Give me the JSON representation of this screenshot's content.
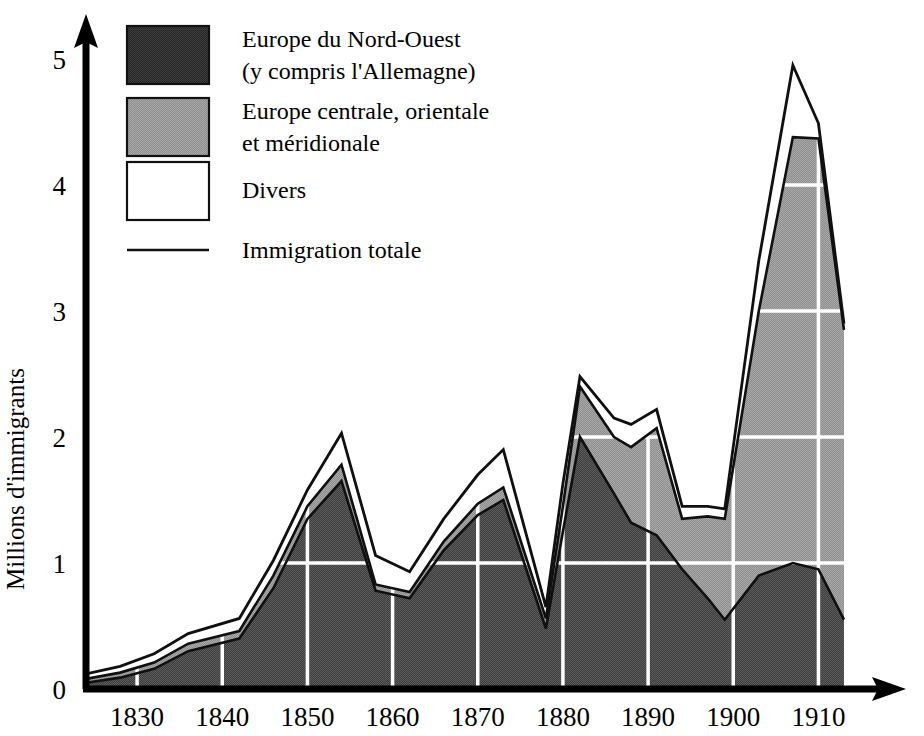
{
  "chart_data": {
    "type": "area",
    "title": "",
    "xlabel": "",
    "ylabel": "Millions d'immigrants",
    "xlim": [
      1824,
      1915
    ],
    "ylim": [
      0,
      5
    ],
    "xticks": [
      "1830",
      "1840",
      "1850",
      "1860",
      "1870",
      "1880",
      "1890",
      "1900",
      "1910"
    ],
    "xtick_values": [
      1830,
      1840,
      1850,
      1860,
      1870,
      1880,
      1890,
      1900,
      1910
    ],
    "yticks": [
      "0",
      "1",
      "2",
      "3",
      "4",
      "5"
    ],
    "ytick_values": [
      0,
      1,
      2,
      3,
      4,
      5
    ],
    "grid": true,
    "grid_color": "#ffffff",
    "stacked": true,
    "legend_position": "top-left",
    "x": [
      1824,
      1828,
      1832,
      1836,
      1842,
      1846,
      1850,
      1854,
      1858,
      1862,
      1866,
      1870,
      1873,
      1878,
      1880,
      1882,
      1886,
      1888,
      1891,
      1894,
      1897,
      1899,
      1903,
      1907,
      1910,
      1913
    ],
    "series": [
      {
        "name": "Europe du Nord-Ouest (y compris l'Allemagne)",
        "color": "#4d4d4d",
        "values": [
          0.05,
          0.09,
          0.16,
          0.3,
          0.4,
          0.8,
          1.35,
          1.65,
          0.78,
          0.72,
          1.1,
          1.38,
          1.5,
          0.48,
          1.25,
          2.0,
          1.55,
          1.32,
          1.22,
          0.95,
          0.72,
          0.55,
          0.9,
          1.0,
          0.95,
          0.55
        ]
      },
      {
        "name": "Europe centrale, orientale et méridionale",
        "color": "#9a9a9a",
        "values": [
          0.03,
          0.04,
          0.05,
          0.06,
          0.06,
          0.1,
          0.1,
          0.13,
          0.05,
          0.05,
          0.07,
          0.09,
          0.1,
          0.08,
          0.2,
          0.4,
          0.45,
          0.6,
          0.85,
          0.4,
          0.65,
          0.8,
          2.1,
          3.38,
          3.42,
          2.3
        ]
      },
      {
        "name": "Divers",
        "color": "#ffffff",
        "values": [
          0.04,
          0.05,
          0.07,
          0.08,
          0.1,
          0.12,
          0.13,
          0.25,
          0.23,
          0.16,
          0.18,
          0.23,
          0.3,
          0.09,
          0.18,
          0.08,
          0.15,
          0.18,
          0.15,
          0.1,
          0.08,
          0.08,
          0.4,
          0.57,
          0.12,
          0.05
        ]
      }
    ],
    "total_line": {
      "name": "Immigration totale",
      "color": "#1a1a1a",
      "values": [
        0.12,
        0.18,
        0.28,
        0.44,
        0.56,
        1.02,
        1.58,
        2.03,
        1.06,
        0.93,
        1.35,
        1.7,
        1.9,
        0.65,
        1.63,
        2.48,
        2.15,
        2.1,
        2.22,
        1.45,
        1.45,
        1.43,
        3.4,
        4.95,
        4.49,
        2.9
      ]
    }
  },
  "legend": {
    "items": [
      {
        "label_line1": "Europe du Nord-Ouest",
        "label_line2": "(y compris l'Allemagne)",
        "swatch": "dark",
        "color": "#333333"
      },
      {
        "label_line1": "Europe centrale, orientale",
        "label_line2": "et méridionale",
        "swatch": "gray",
        "color": "#9a9a9a"
      },
      {
        "label_line1": "Divers",
        "label_line2": "",
        "swatch": "white",
        "color": "#ffffff"
      },
      {
        "label_line1": "Immigration totale",
        "label_line2": "",
        "swatch": "line",
        "color": "#1a1a1a"
      }
    ]
  },
  "axes": {
    "y_title": "Millions d'immigrants",
    "y_labels": [
      "5",
      "4",
      "3",
      "2",
      "1",
      "0"
    ],
    "x_labels": [
      "1830",
      "1840",
      "1850",
      "1860",
      "1870",
      "1880",
      "1890",
      "1900",
      "1910"
    ]
  }
}
